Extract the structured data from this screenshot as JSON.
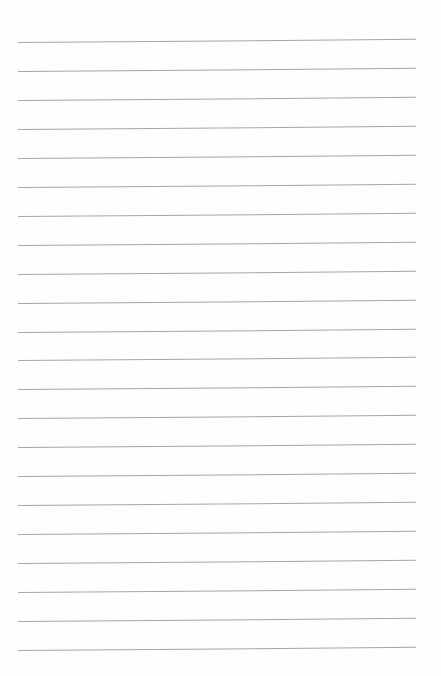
{
  "page": {
    "type": "lined-paper",
    "line_count": 22,
    "first_line_y": 42,
    "line_spacing": 28.95,
    "line_left": 18,
    "line_width": 398,
    "line_color": "#a6a6a6",
    "background_color": "#fefefe"
  }
}
